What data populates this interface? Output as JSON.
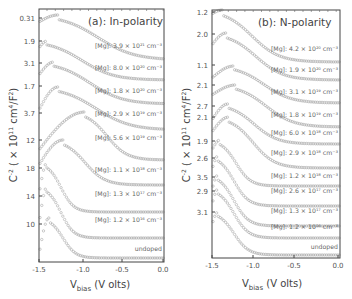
{
  "chart_data": [
    {
      "type": "line",
      "title": "(a): In-polarity",
      "xlabel": "V_bias (V olts)",
      "xlabel_main": "V",
      "xlabel_sub": "bias",
      "xlabel_rest": " (V olts)",
      "ylabel": "C^-2 ( × 10^11 cm^4/F^2)",
      "xlim": [
        -1.5,
        0.0
      ],
      "x_ticks": [
        "-1.5",
        "-1.0",
        "-0.5",
        "0.0"
      ],
      "y_ticks": [
        "0.31",
        "1.9",
        "3.1",
        "1.7",
        "3.7",
        "12",
        "18",
        "14",
        "10"
      ],
      "grid": false,
      "series": [
        {
          "name": "[Mg]: 3.9 × 10^21 cm^-3",
          "label": "[Mg]: 3.9 × 10²¹ cm⁻³",
          "peak_x": -1.25,
          "tail": "broad"
        },
        {
          "name": "[Mg]: 8.0 × 10^20 cm^-3",
          "label": "[Mg]: 8.0 × 10²⁰ cm⁻³",
          "peak_x": -1.4,
          "tail": "broad"
        },
        {
          "name": "[Mg]: 1.8 × 10^20 cm^-3",
          "label": "[Mg]: 1.8 × 10²⁰ cm⁻³",
          "peak_x": -1.3,
          "tail": "broad"
        },
        {
          "name": "[Mg]: 2.9 × 10^19 cm^-3",
          "label": "[Mg]: 2.9 × 10¹⁹ cm⁻³",
          "peak_x": -1.25,
          "tail": "broad"
        },
        {
          "name": "[Mg]: 5.6 × 10^19 cm^-3",
          "label": "[Mg]: 5.6 × 10¹⁹ cm⁻³",
          "peak_x": -0.95,
          "tail": "sharp"
        },
        {
          "name": "[Mg]: 1.1 × 10^18 cm^-3",
          "label": "[Mg]: 1.1 × 10¹⁸ cm⁻³",
          "peak_x": -1.25,
          "tail": "sharp"
        },
        {
          "name": "[Mg]: 1.3 × 10^17 cm^-3",
          "label": "[Mg]: 1.3 × 10¹⁷ cm⁻³",
          "peak_x": -1.4,
          "tail": "sharp"
        },
        {
          "name": "[Mg]: 1.2 × 10^16 cm^-3",
          "label": "[Mg]: 1.2 × 10¹⁶ cm⁻³",
          "peak_x": -1.4,
          "tail": "sharp"
        },
        {
          "name": "undoped",
          "label": "undoped",
          "peak_x": -1.4,
          "tail": "sharp"
        }
      ]
    },
    {
      "type": "line",
      "title": "(b): N-polarity",
      "xlabel": "V_bias (V olts)",
      "xlabel_main": "V",
      "xlabel_sub": "bias",
      "xlabel_rest": " (V olts)",
      "ylabel": "C^-2 ( × 10^11 cm^4/F^2)",
      "xlim": [
        -1.5,
        0.0
      ],
      "x_ticks": [
        "-1.5",
        "-1.0",
        "-0.5",
        "0.0"
      ],
      "y_ticks": [
        "1.2",
        "2.0",
        "1.1",
        "2.1",
        "2.7",
        "2.1",
        "1.9",
        "2.6",
        "3.5",
        "2.9",
        "3.1"
      ],
      "grid": false,
      "series": [
        {
          "name": "[Mg]: 4.2 × 10^20 cm^-3",
          "label": "[Mg]: 4.2 × 10²⁰ cm⁻³"
        },
        {
          "name": "[Mg]: 1.9 × 10^20 cm^-3",
          "label": "[Mg]: 1.9 × 10²⁰ cm⁻³"
        },
        {
          "name": "[Mg]: 3.1 × 10^19 cm^-3",
          "label": "[Mg]: 3.1 × 10¹⁹ cm⁻³"
        },
        {
          "name": "[Mg]: 1.8 × 10^19 cm^-3",
          "label": "[Mg]: 1.8 × 10¹⁹ cm⁻³"
        },
        {
          "name": "[Mg]: 6.0 × 10^18 cm^-3",
          "label": "[Mg]: 6.0 × 10¹⁸ cm⁻³"
        },
        {
          "name": "[Mg]: 2.9 × 10^18 cm^-3",
          "label": "[Mg]: 2.9 × 10¹⁸ cm⁻³"
        },
        {
          "name": "[Mg]: 1.2 × 10^18 cm^-3",
          "label": "[Mg]: 1.2 × 10¹⁸ cm⁻³"
        },
        {
          "name": "[Mg]: 2.6 × 10^17 cm^-3",
          "label": "[Mg]: 2.6 × 10¹⁷ cm⁻³"
        },
        {
          "name": "[Mg]: 1.3 × 10^17 cm^-3",
          "label": "[Mg]: 1.3 × 10¹⁷ cm⁻³"
        },
        {
          "name": "[Mg]: 1.2 × 10^16 cm^-3",
          "label": "[Mg]: 1.2 × 10¹⁶ cm⁻³"
        },
        {
          "name": "undoped",
          "label": "undoped"
        }
      ]
    }
  ],
  "colors": {
    "frame": "#444444",
    "marker": "#a8a8a8",
    "text": "#555555"
  }
}
